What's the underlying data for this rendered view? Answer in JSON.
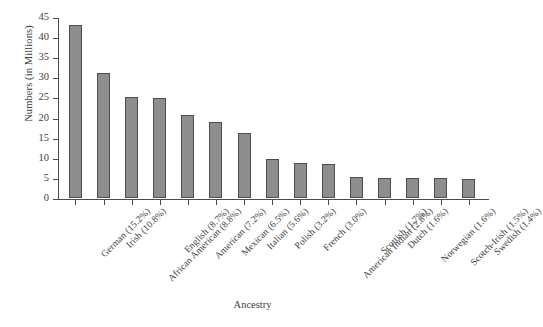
{
  "chart_data": {
    "type": "bar",
    "title": "",
    "xlabel": "Ancestry",
    "ylabel": "Numbers (in Millions)",
    "ylim": [
      0,
      45
    ],
    "yticks": [
      0,
      5,
      10,
      15,
      20,
      25,
      30,
      35,
      40,
      45
    ],
    "grid": false,
    "legend": null,
    "bar_color": "#8e8e8e",
    "bar_edge_color": "#4d4d4d",
    "categories": [
      "German (15.2%)",
      "Irish (10.8%)",
      "African American (8.8%)",
      "English (8.7%)",
      "American (7.2%)",
      "Mexican (6.5%)",
      "Italian (5.6%)",
      "Polish (3.2%)",
      "French (3.0%)",
      "American Indian (2.8%)",
      "Scottish (1.7%)",
      "Dutch (1.6%)",
      "Norwegian (1.6%)",
      "Scotch-Irish (1.5%)",
      "Swedish (1.4%)"
    ],
    "values": [
      43.0,
      31.0,
      25.2,
      24.9,
      20.6,
      18.8,
      16.2,
      9.6,
      8.7,
      8.4,
      5.3,
      5.0,
      5.1,
      4.9,
      4.7
    ]
  }
}
